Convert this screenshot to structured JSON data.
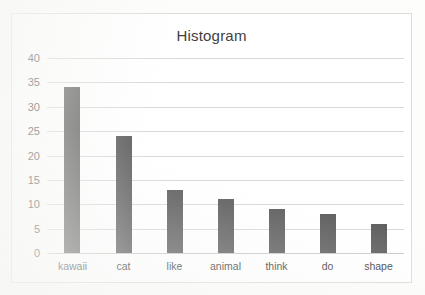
{
  "chart_data": {
    "type": "bar",
    "title": "Histogram",
    "xlabel": "",
    "ylabel": "",
    "categories": [
      "kawaii",
      "cat",
      "like",
      "animal",
      "think",
      "do",
      "shape"
    ],
    "values": [
      34,
      24,
      13,
      11,
      9,
      8,
      6
    ],
    "series": [
      {
        "name": "Histogram",
        "values": [
          34,
          24,
          13,
          11,
          9,
          8,
          6
        ]
      }
    ],
    "ylim": [
      0,
      40
    ],
    "ytick_labels": [
      "0",
      "5",
      "10",
      "15",
      "20",
      "25",
      "30",
      "35",
      "40"
    ],
    "ytick_values": [
      0,
      5,
      10,
      15,
      20,
      25,
      30,
      35,
      40
    ],
    "grid": true,
    "grid_axis": "y",
    "legend": false,
    "legend_position": "none",
    "bar_color": "#5f5f5f",
    "gridline_color": "#d9d9d9",
    "plot_background": "#ffffff",
    "border_color": "#dcdcdc"
  }
}
